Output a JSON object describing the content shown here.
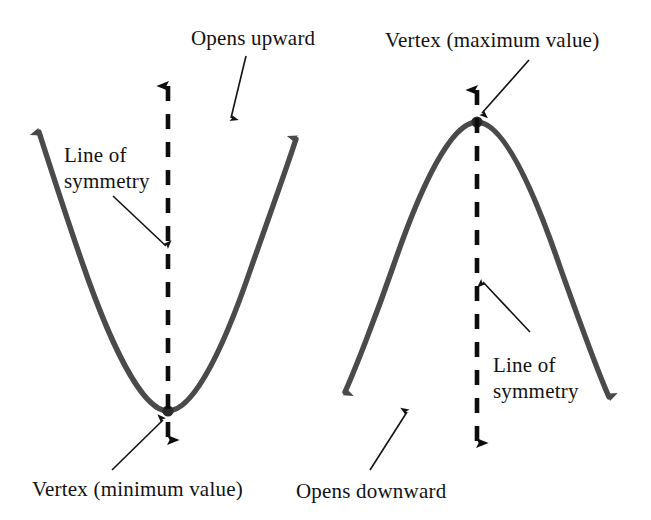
{
  "figure": {
    "type": "diagram",
    "background_color": "#ffffff",
    "curve_color": "#4a4a4a",
    "annotation_color": "#121212"
  },
  "labels": {
    "opens_upward": "Opens upward",
    "line_of_symmetry_left": "Line of\nsymmetry",
    "vertex_minimum": "Vertex (minimum value)",
    "vertex_maximum": "Vertex (maximum value)",
    "line_of_symmetry_right": "Line of\nsymmetry",
    "opens_downward": "Opens downward"
  },
  "diagrams": [
    {
      "name": "upward-parabola",
      "opens": "upward",
      "vertex": {
        "x": 168,
        "y": 411,
        "kind": "minimum"
      },
      "arms": [
        {
          "side": "left",
          "tip": {
            "x": 33,
            "y": 118
          }
        },
        {
          "side": "right",
          "tip": {
            "x": 302,
            "y": 125
          }
        }
      ],
      "axis_of_symmetry": {
        "x": 168,
        "top_y": 74,
        "bottom_y": 452,
        "style": "dashed",
        "arrowheads": "both"
      }
    },
    {
      "name": "downward-parabola",
      "opens": "downward",
      "vertex": {
        "x": 477,
        "y": 122,
        "kind": "maximum"
      },
      "arms": [
        {
          "side": "left",
          "tip": {
            "x": 339,
            "y": 401
          }
        },
        {
          "side": "right",
          "tip": {
            "x": 615,
            "y": 406
          }
        }
      ],
      "axis_of_symmetry": {
        "x": 477,
        "top_y": 78,
        "bottom_y": 455,
        "style": "dashed",
        "arrowheads": "both"
      }
    }
  ],
  "leader_lines": [
    {
      "name": "opens-upward-pointer",
      "from": {
        "x": 246,
        "y": 56
      },
      "to": {
        "x": 231,
        "y": 118
      }
    },
    {
      "name": "line-sym-left-pointer",
      "from": {
        "x": 113,
        "y": 196
      },
      "to": {
        "x": 166,
        "y": 246
      }
    },
    {
      "name": "vertex-min-pointer",
      "from": {
        "x": 112,
        "y": 470
      },
      "to": {
        "x": 163,
        "y": 420
      }
    },
    {
      "name": "vertex-max-pointer",
      "from": {
        "x": 529,
        "y": 60
      },
      "to": {
        "x": 482,
        "y": 113
      }
    },
    {
      "name": "line-sym-right-pointer",
      "from": {
        "x": 530,
        "y": 332
      },
      "to": {
        "x": 483,
        "y": 282
      }
    },
    {
      "name": "opens-downward-pointer",
      "from": {
        "x": 370,
        "y": 470
      },
      "to": {
        "x": 407,
        "y": 412
      }
    }
  ]
}
